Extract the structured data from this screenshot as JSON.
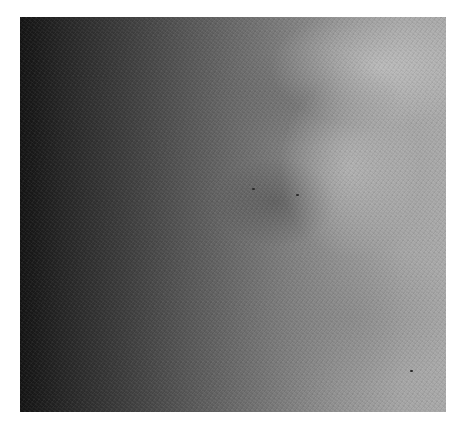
{
  "image": {
    "description": "Grayscale noisy scan-like photograph with dark left edge, brighter right side, and a faint dark blotch near center",
    "colors": {
      "background": "#ffffff",
      "darkest": "#141414",
      "mid": "#777777",
      "lightest": "#aaaaaa"
    }
  }
}
